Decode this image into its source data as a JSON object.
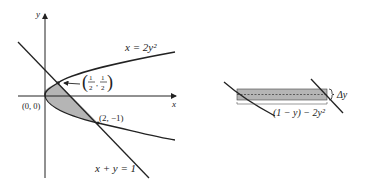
{
  "left_figure": {
    "axis_x_label": "x",
    "axis_y_label": "y",
    "curve_label": "x = 2y²",
    "line_label": "x + y = 1",
    "origin_label": "(0, 0)",
    "point_top_label_num": "1",
    "point_top_label_den": "2",
    "point_bottom_label": "(2, −1)",
    "shade_color": "#b5b5b5"
  },
  "right_figure": {
    "width_label": "(1 − y) − 2y²",
    "height_label": "Δy",
    "shade_color": "#b5b5b5"
  }
}
